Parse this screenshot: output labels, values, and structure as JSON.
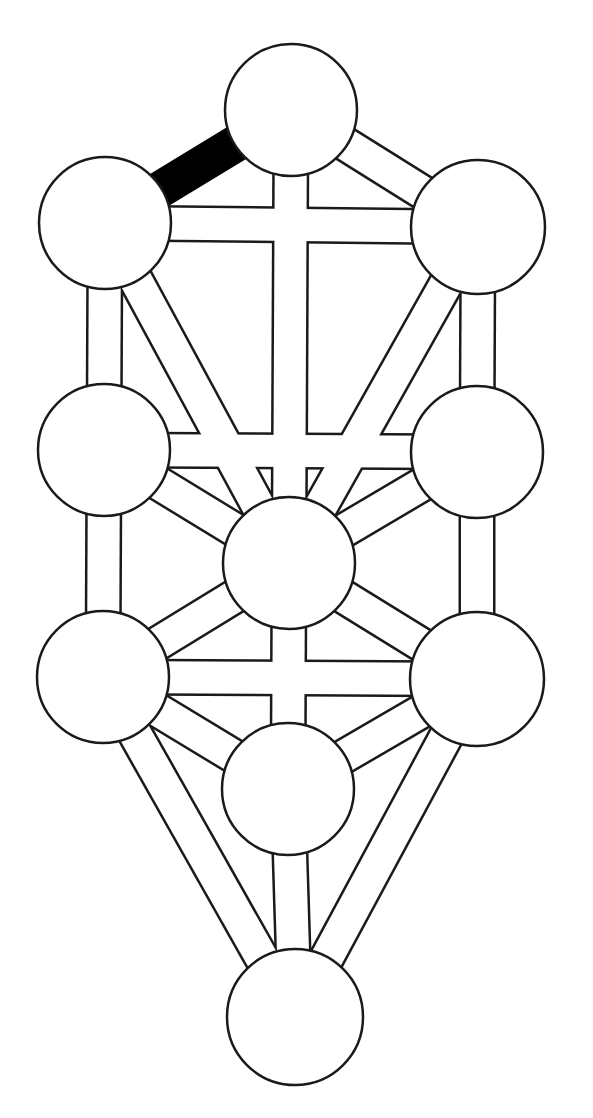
{
  "diagram": {
    "type": "tree-of-life",
    "colors": {
      "background": "#ffffff",
      "stroke": "#1a1a1a",
      "fill": "#ffffff",
      "highlight": "#000000"
    },
    "nodes": [
      {
        "id": "kether",
        "cx": 291,
        "cy": 110,
        "r": 66
      },
      {
        "id": "chokmah",
        "cx": 105,
        "cy": 223,
        "r": 66
      },
      {
        "id": "binah",
        "cx": 478,
        "cy": 227,
        "r": 67
      },
      {
        "id": "chesed",
        "cx": 104,
        "cy": 450,
        "r": 66
      },
      {
        "id": "geburah",
        "cx": 477,
        "cy": 452,
        "r": 66
      },
      {
        "id": "tiphareth",
        "cx": 289,
        "cy": 563,
        "r": 66
      },
      {
        "id": "hod-left",
        "cx": 103,
        "cy": 677,
        "r": 66
      },
      {
        "id": "netzach-right",
        "cx": 477,
        "cy": 679,
        "r": 67
      },
      {
        "id": "yesod",
        "cx": 288,
        "cy": 789,
        "r": 66
      },
      {
        "id": "malkuth",
        "cx": 295,
        "cy": 1017,
        "r": 68
      }
    ],
    "paths": [
      {
        "from": 0,
        "to": 1,
        "highlighted": true
      },
      {
        "from": 0,
        "to": 2,
        "highlighted": false
      },
      {
        "from": 0,
        "to": 5,
        "highlighted": false
      },
      {
        "from": 1,
        "to": 2,
        "highlighted": false
      },
      {
        "from": 1,
        "to": 5,
        "highlighted": false
      },
      {
        "from": 1,
        "to": 3,
        "highlighted": false
      },
      {
        "from": 2,
        "to": 5,
        "highlighted": false
      },
      {
        "from": 2,
        "to": 4,
        "highlighted": false
      },
      {
        "from": 3,
        "to": 4,
        "highlighted": false
      },
      {
        "from": 3,
        "to": 5,
        "highlighted": false
      },
      {
        "from": 3,
        "to": 6,
        "highlighted": false
      },
      {
        "from": 4,
        "to": 5,
        "highlighted": false
      },
      {
        "from": 4,
        "to": 7,
        "highlighted": false
      },
      {
        "from": 5,
        "to": 6,
        "highlighted": false
      },
      {
        "from": 5,
        "to": 8,
        "highlighted": false
      },
      {
        "from": 5,
        "to": 7,
        "highlighted": false
      },
      {
        "from": 6,
        "to": 7,
        "highlighted": false
      },
      {
        "from": 6,
        "to": 8,
        "highlighted": false
      },
      {
        "from": 6,
        "to": 9,
        "highlighted": false
      },
      {
        "from": 7,
        "to": 8,
        "highlighted": false
      },
      {
        "from": 7,
        "to": 9,
        "highlighted": false
      },
      {
        "from": 8,
        "to": 9,
        "highlighted": false
      }
    ],
    "path_width": 32
  }
}
